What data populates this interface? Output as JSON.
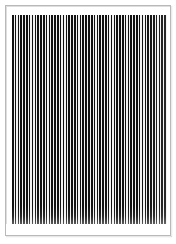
{
  "image": {
    "kind": "test-pattern",
    "title": "Vertical Line Grating Test Pattern",
    "description": "A dense black-and-white vertical bar grating inside a thin gray rectangular frame on a white background.",
    "width_px": 176,
    "height_px": 244,
    "background_color": "#ffffff"
  },
  "frame": {
    "name": "chart-border",
    "stroke_color": "#b9b9b9",
    "stroke_width_px": 1,
    "left_px": 5,
    "top_px": 5,
    "width_px": 166,
    "height_px": 231,
    "fill_color": "#ffffff"
  },
  "grating": {
    "name": "vertical-line-grating",
    "orientation": "vertical",
    "bar_color": "#111111",
    "gap_color": "#f2f2f2",
    "left_px": 12,
    "top_px": 15,
    "width_px": 155,
    "height_px": 209,
    "period_px": 2.82,
    "bar_width_px": 1.55,
    "gap_width_px": 1.27,
    "duty_cycle_percent": 55,
    "bar_count": 55,
    "contrast": "high"
  },
  "quiet_zone": {
    "name": "bottom-quiet-zone",
    "top_px": 224,
    "height_px": 11,
    "color": "#ffffff"
  },
  "chart_data": {
    "type": "bar",
    "title": "Vertical Line Grating Test Pattern",
    "subtitle": "",
    "xlabel": "",
    "ylabel": "",
    "grid": false,
    "legend": null,
    "categories": [
      "1",
      "2",
      "3",
      "4",
      "5",
      "6",
      "7",
      "8",
      "9",
      "10",
      "11",
      "12",
      "13",
      "14",
      "15",
      "16",
      "17",
      "18",
      "19",
      "20",
      "21",
      "22",
      "23",
      "24",
      "25",
      "26",
      "27",
      "28",
      "29",
      "30",
      "31",
      "32",
      "33",
      "34",
      "35",
      "36",
      "37",
      "38",
      "39",
      "40",
      "41",
      "42",
      "43",
      "44",
      "45",
      "46",
      "47",
      "48",
      "49",
      "50",
      "51",
      "52",
      "53",
      "54",
      "55"
    ],
    "values": [
      100,
      100,
      100,
      100,
      100,
      100,
      100,
      100,
      100,
      100,
      100,
      100,
      100,
      100,
      100,
      100,
      100,
      100,
      100,
      100,
      100,
      100,
      100,
      100,
      100,
      100,
      100,
      100,
      100,
      100,
      100,
      100,
      100,
      100,
      100,
      100,
      100,
      100,
      100,
      100,
      100,
      100,
      100,
      100,
      100,
      100,
      100,
      100,
      100,
      100,
      100,
      100,
      100,
      100,
      100
    ],
    "ylim": [
      0,
      100
    ],
    "bar_color": "#111111",
    "gap_color": "#f2f2f2"
  }
}
